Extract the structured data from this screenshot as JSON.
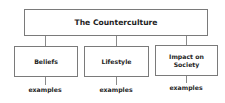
{
  "diagram": {
    "title": "The Counterculture",
    "branches": [
      {
        "label": "Beliefs",
        "sublabel": "examples"
      },
      {
        "label": "Lifestyle",
        "sublabel": "examples"
      },
      {
        "label": "Impact on Society",
        "sublabel": "examples"
      }
    ],
    "colors": {
      "border": "#7a7a7a",
      "line": "#8a8a8a",
      "text": "#1e1e1e",
      "background": "#ffffff"
    }
  }
}
